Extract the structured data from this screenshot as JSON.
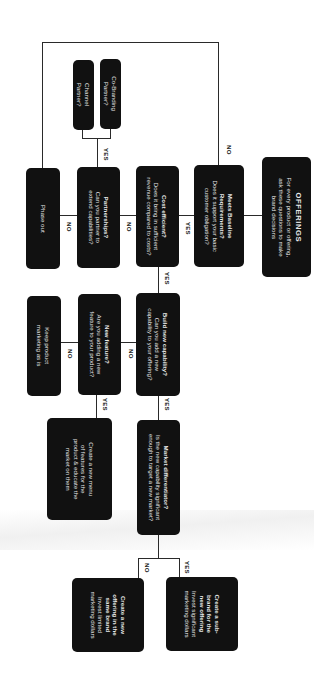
{
  "orientation": "rotated 90 degrees clockwise",
  "colors": {
    "box_fill": "#111111",
    "box_text": "#e9e9e9",
    "connector": "#2a2a2a",
    "background": "#ffffff"
  },
  "nodes": {
    "offerings": {
      "title": "OFFERINGS",
      "lines": [
        "For every product or offering,",
        "ask these questions to make",
        "brand decisions"
      ]
    },
    "meets_baseline": {
      "title_lines": [
        "Meets Baseline",
        "Requirements?"
      ],
      "lines": [
        "Does it support your basic",
        "customer obligation?"
      ]
    },
    "cost_efficient": {
      "title": "Cost efficient?",
      "lines": [
        "Does it bring in sufficient",
        "revenue compared to costs?"
      ]
    },
    "partnerships": {
      "title": "Partnerships?",
      "lines": [
        "Can you partner to",
        "extend capabilities?"
      ]
    },
    "phase_out": {
      "text": "Phase out"
    },
    "co_branding": {
      "lines": [
        "Co-Branding",
        "Partner?"
      ]
    },
    "channel_partner": {
      "lines": [
        "Channel",
        "Partner?"
      ]
    },
    "build_new_capability": {
      "title": "Build new capability?",
      "lines": [
        "Can you add a new",
        "capability to your offering?"
      ]
    },
    "new_feature": {
      "title": "New feature?",
      "lines": [
        "Are you adding a new",
        "feature to your product?"
      ]
    },
    "keep_marketing": {
      "lines": [
        "Keep product",
        "marketing as is"
      ]
    },
    "create_menu": {
      "lines": [
        "Create a new menu",
        "of features for the",
        "product & educate the",
        "market on them"
      ]
    },
    "market_differentiator": {
      "title": "Market differentiator?",
      "lines": [
        "Is the new capability significant",
        "enough to target a new market?"
      ]
    },
    "sub_brand": {
      "title_lines": [
        "Create a sub-",
        "brand for the",
        "new offering"
      ],
      "lines": [
        "Invest significant",
        "marketing dollars"
      ]
    },
    "same_brand": {
      "title_lines": [
        "Create a new",
        "offering in the",
        "same brand"
      ],
      "lines": [
        "Invest limited",
        "marketing dollars"
      ]
    }
  },
  "edge_labels": {
    "baseline_no": "NO",
    "baseline_yes": "YES",
    "cost_no": "NO",
    "cost_yes": "YES",
    "partner_no": "NO",
    "partner_yes": "YES",
    "build_no": "NO",
    "build_yes": "YES",
    "feature_no": "NO",
    "feature_yes": "YES",
    "market_yes": "YES",
    "market_no": "NO"
  }
}
